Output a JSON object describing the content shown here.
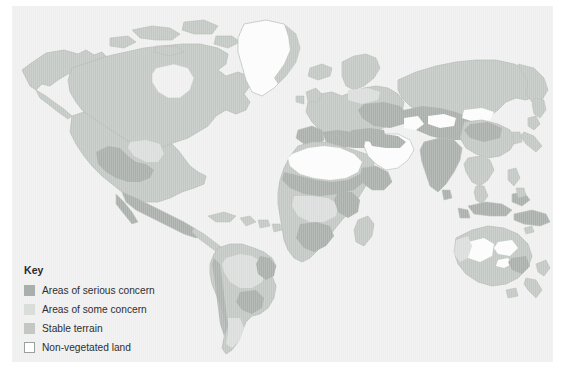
{
  "figure": {
    "type": "thematic-world-map",
    "background_color": "#ffffff",
    "panel_color": "#eef0ee"
  },
  "legend": {
    "title": "Key",
    "items": [
      {
        "label": "Areas of serious concern",
        "color": "#a9afab",
        "style": "filled",
        "swatch_name": "swatch-serious-concern"
      },
      {
        "label": "Areas of some concern",
        "color": "#dadedb",
        "style": "filled",
        "swatch_name": "swatch-some-concern"
      },
      {
        "label": "Stable terrain",
        "color": "#c3c8c4",
        "style": "filled",
        "swatch_name": "swatch-stable-terrain"
      },
      {
        "label": "Non-vegetated land",
        "color": "#ffffff",
        "style": "outlined",
        "swatch_name": "swatch-non-vegetated"
      }
    ]
  },
  "map_colors": {
    "serious_concern": "#a9afab",
    "some_concern": "#dadedb",
    "stable_terrain": "#c3c8c4",
    "non_vegetated": "#fbfcfb",
    "ocean": "#eef0ee",
    "coastline": "#b9bfba"
  },
  "regions": [
    {
      "name": "North America",
      "dominant": "stable_terrain",
      "notes": "serious concern patches in south-west United States and northern Mexico"
    },
    {
      "name": "Greenland",
      "dominant": "non_vegetated"
    },
    {
      "name": "South America",
      "dominant": "stable_terrain",
      "notes": "some concern across Amazon basin; serious concern in north-east Brazil and Patagonia"
    },
    {
      "name": "Europe",
      "dominant": "stable_terrain",
      "notes": "serious concern around the Mediterranean and steppe belt"
    },
    {
      "name": "Africa",
      "dominant": "serious_concern",
      "notes": "Sahara non-vegetated; Sahel and southern Africa show serious concern"
    },
    {
      "name": "Middle East",
      "dominant": "non_vegetated",
      "notes": "Arabian Peninsula largely non-vegetated with serious concern margins"
    },
    {
      "name": "Central Asia",
      "dominant": "serious_concern",
      "notes": "Gobi and Taklamakan deserts non-vegetated"
    },
    {
      "name": "South Asia",
      "dominant": "serious_concern",
      "notes": "Indian subcontinent heavily affected"
    },
    {
      "name": "Siberia and East Asia",
      "dominant": "stable_terrain"
    },
    {
      "name": "South-East Asia",
      "dominant": "stable_terrain"
    },
    {
      "name": "Australia",
      "dominant": "some_concern",
      "notes": "interior deserts non-vegetated, serious concern in the south-east"
    },
    {
      "name": "New Zealand",
      "dominant": "stable_terrain"
    }
  ]
}
